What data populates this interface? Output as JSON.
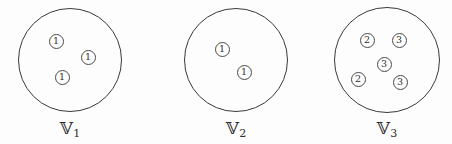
{
  "figure": {
    "background_color": "#fdfdfd",
    "stroke_color": "#3a3a3a",
    "token_color": "#2e2e2e",
    "groups": [
      {
        "name": "group-1",
        "label_symbol": "ᵔ",
        "label_base": "𝕍",
        "label_subscript": "1",
        "circle": {
          "cx": 70,
          "cy": 60,
          "r": 52
        },
        "tokens": [
          {
            "value": "1",
            "x": 56,
            "y": 41
          },
          {
            "value": "1",
            "x": 88,
            "y": 57
          },
          {
            "value": "1",
            "x": 62,
            "y": 77
          }
        ]
      },
      {
        "name": "group-2",
        "label_base": "𝕍",
        "label_subscript": "2",
        "circle": {
          "cx": 236,
          "cy": 60,
          "r": 52
        },
        "tokens": [
          {
            "value": "1",
            "x": 222,
            "y": 49
          },
          {
            "value": "1",
            "x": 244,
            "y": 72
          }
        ]
      },
      {
        "name": "group-3",
        "label_base": "𝕍",
        "label_subscript": "3",
        "circle": {
          "cx": 387,
          "cy": 60,
          "r": 53
        },
        "tokens": [
          {
            "value": "2",
            "x": 367,
            "y": 40
          },
          {
            "value": "3",
            "x": 399,
            "y": 40
          },
          {
            "value": "3",
            "x": 384,
            "y": 64
          },
          {
            "value": "2",
            "x": 358,
            "y": 79
          },
          {
            "value": "3",
            "x": 400,
            "y": 82
          }
        ]
      }
    ]
  }
}
